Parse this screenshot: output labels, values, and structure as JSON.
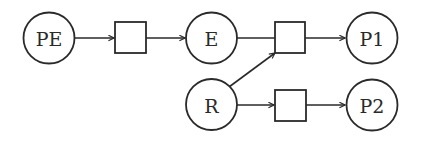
{
  "diagram": {
    "type": "petri-net",
    "places": [
      {
        "id": "PE",
        "label": "PE"
      },
      {
        "id": "E",
        "label": "E"
      },
      {
        "id": "R",
        "label": "R"
      },
      {
        "id": "P1",
        "label": "P1"
      },
      {
        "id": "P2",
        "label": "P2"
      }
    ],
    "transitions": [
      {
        "id": "t1",
        "label": ""
      },
      {
        "id": "t2",
        "label": ""
      },
      {
        "id": "t3",
        "label": ""
      }
    ],
    "arcs": [
      {
        "from": "PE",
        "to": "t1",
        "arrow": true
      },
      {
        "from": "t1",
        "to": "E",
        "arrow": true
      },
      {
        "from": "E",
        "to": "t2",
        "arrow": false
      },
      {
        "from": "R",
        "to": "t2",
        "arrow": true
      },
      {
        "from": "t2",
        "to": "P1",
        "arrow": true
      },
      {
        "from": "R",
        "to": "t3",
        "arrow": true
      },
      {
        "from": "t3",
        "to": "P2",
        "arrow": true
      }
    ],
    "colors": {
      "stroke": "#2a2a2a",
      "fill": "#ffffff",
      "background": "#ffffff"
    }
  }
}
